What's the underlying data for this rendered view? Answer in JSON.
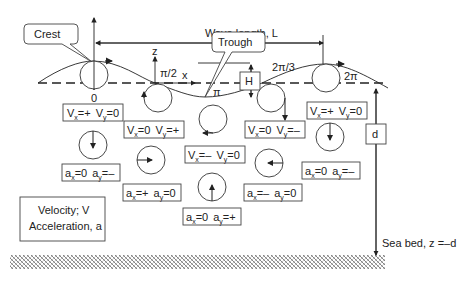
{
  "title_labels": {
    "crest": "Crest",
    "trough": "Trough",
    "wave_length": "Wave length, L",
    "height": "H",
    "depth": "d",
    "z_axis": "z",
    "x_axis": "x",
    "sea_bed": "Sea bed, z =–d"
  },
  "phases": [
    "0",
    "π/2",
    "π",
    "2π/3",
    "2π"
  ],
  "velocity_boxes": [
    {
      "vx": "+",
      "vy": "0"
    },
    {
      "vx": "0",
      "vy": "+"
    },
    {
      "vx": "–",
      "vy": "0"
    },
    {
      "vx": "0",
      "vy": "–"
    },
    {
      "vx": "+",
      "vy": "0"
    }
  ],
  "acceleration_boxes": [
    {
      "ax": "0",
      "ay": "–"
    },
    {
      "ax": "+",
      "ay": "0"
    },
    {
      "ax": "0",
      "ay": "+"
    },
    {
      "ax": "–",
      "ay": "0"
    },
    {
      "ax": "0",
      "ay": "–"
    }
  ],
  "legend": {
    "line1": "Velocity; V",
    "line2": "Acceleration, a"
  },
  "symbols": {
    "V": "V",
    "a": "a",
    "x_sub": "x",
    "y_sub": "y",
    "eq": "="
  }
}
